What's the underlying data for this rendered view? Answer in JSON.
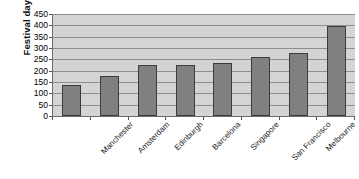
{
  "chart_data": {
    "type": "bar",
    "title": "",
    "subtitle": "",
    "xlabel": "",
    "ylabel": "Festival days",
    "ylim": [
      0,
      450
    ],
    "ytick_step": 50,
    "yticks": [
      450,
      400,
      350,
      300,
      250,
      200,
      150,
      100,
      50,
      0
    ],
    "grid": true,
    "legend": false,
    "legend_position": "none",
    "categories": [
      "Manchester",
      "Amsterdam",
      "Edinburgh",
      "Barcelona",
      "Singapore",
      "San Francisco",
      "Melbourne",
      "Montréal"
    ],
    "values": [
      137,
      178,
      225,
      225,
      235,
      262,
      278,
      397
    ],
    "series": [
      {
        "name": "Festival days",
        "values": [
          137,
          178,
          225,
          225,
          235,
          262,
          278,
          397
        ]
      }
    ]
  },
  "style": {
    "bar_fill": "#808080",
    "bar_border": "#3c3c3c",
    "plot_background": "#d4d4d4",
    "gridline_color": "#8e8e8e",
    "axis_color": "#6b6b6b",
    "text_color": "#111111",
    "page_background": "#ffffff"
  }
}
